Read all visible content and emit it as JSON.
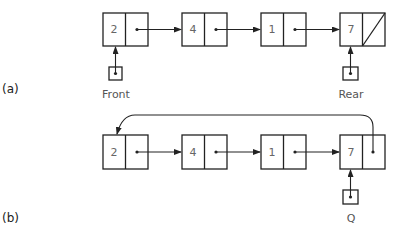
{
  "figure_a": {
    "part_label": "(a)",
    "nodes": [
      {
        "value": "2"
      },
      {
        "value": "4"
      },
      {
        "value": "1"
      },
      {
        "value": "7",
        "next": "null"
      }
    ],
    "front_label": "Front",
    "rear_label": "Rear"
  },
  "figure_b": {
    "part_label": "(b)",
    "nodes": [
      {
        "value": "2"
      },
      {
        "value": "4"
      },
      {
        "value": "1"
      },
      {
        "value": "7",
        "next": "circular-to-first"
      }
    ],
    "pointer_label": "Q"
  },
  "colors": {
    "stroke": "#222222",
    "text": "#555555"
  }
}
